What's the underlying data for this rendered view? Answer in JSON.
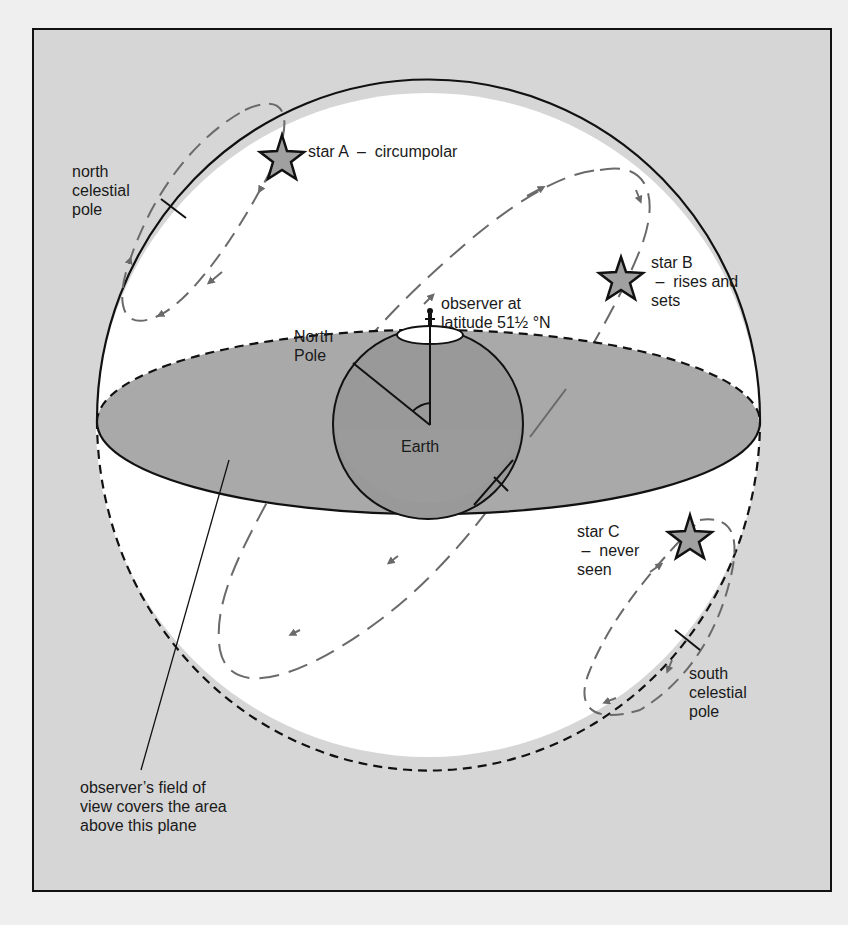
{
  "diagram": {
    "colors": {
      "background": "#d6d6d6",
      "sphere": "#ffffff",
      "horizon_plane": "#a9a9a9",
      "earth": "#9a9a9a",
      "star_fill": "#a0a0a0",
      "path": "#6a6a6a",
      "outline": "#111111"
    },
    "labels": {
      "north_celestial_pole": "north\ncelestial\npole",
      "star_a": "star A  –  circumpolar",
      "star_b": "star B\n –  rises and\nsets",
      "star_c": "star C\n –  never\nseen",
      "south_celestial_pole": "south\ncelestial\npole",
      "observer": "observer at\nlatitude 51½ °N",
      "north_pole": "North\nPole",
      "earth": "Earth",
      "plane_note": "observer’s field of\nview covers the area\nabove this plane"
    },
    "nodes": [
      {
        "id": "star-a",
        "label": "star A",
        "type": "star",
        "note": "circumpolar"
      },
      {
        "id": "star-b",
        "label": "star B",
        "type": "star",
        "note": "rises and sets"
      },
      {
        "id": "star-c",
        "label": "star C",
        "type": "star",
        "note": "never seen"
      },
      {
        "id": "ncp",
        "label": "north celestial pole",
        "type": "tick-mark"
      },
      {
        "id": "scp",
        "label": "south celestial pole",
        "type": "tick-mark"
      },
      {
        "id": "earth",
        "label": "Earth",
        "type": "sphere"
      },
      {
        "id": "observer",
        "label": "observer at latitude 51½ °N",
        "type": "figure"
      },
      {
        "id": "horizon-plane",
        "label": "observer's horizon plane",
        "type": "ellipse"
      }
    ],
    "edges": [
      {
        "from": "star-a",
        "to": "ncp",
        "kind": "circular path around north celestial pole (always above horizon)"
      },
      {
        "from": "star-b",
        "to": "horizon-plane",
        "kind": "inclined daily path crossing the horizon"
      },
      {
        "from": "star-c",
        "to": "scp",
        "kind": "circular path around south celestial pole (always below horizon)"
      },
      {
        "from": "plane_note",
        "to": "horizon-plane",
        "kind": "leader line"
      }
    ]
  }
}
